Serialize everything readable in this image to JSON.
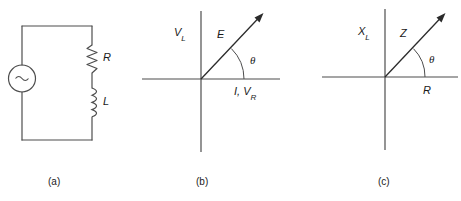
{
  "figure": {
    "line_color": "#4d4d4d",
    "text_color": "#1a1a1a",
    "background": "#ffffff"
  },
  "panels": [
    {
      "id": "a",
      "caption": "(a)",
      "type": "circuit",
      "components": [
        {
          "name": "ac-source",
          "symbol": "~",
          "label": ""
        },
        {
          "name": "resistor",
          "symbol": "zigzag",
          "label": "R"
        },
        {
          "name": "inductor",
          "symbol": "coil",
          "label": "L"
        }
      ]
    },
    {
      "id": "b",
      "caption": "(b)",
      "type": "phasor-diagram",
      "vertical_axis_label": "V",
      "vertical_axis_sub": "L",
      "horizontal_axis_label": "I, V",
      "horizontal_axis_sub": "R",
      "vector_label": "E",
      "angle_label": "θ"
    },
    {
      "id": "c",
      "caption": "(c)",
      "type": "impedance-diagram",
      "vertical_axis_label": "X",
      "vertical_axis_sub": "L",
      "horizontal_axis_label": "R",
      "horizontal_axis_sub": "",
      "vector_label": "Z",
      "angle_label": "θ"
    }
  ]
}
